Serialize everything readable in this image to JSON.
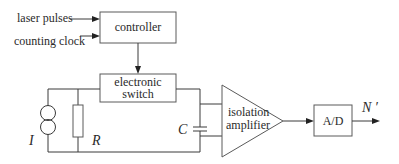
{
  "diagram": {
    "inputs": {
      "laser_pulses": "laser pulses",
      "counting_clock": "counting clock"
    },
    "blocks": {
      "controller": "controller",
      "switch_line1": "electronic",
      "switch_line2": "switch",
      "amplifier_line1": "isolation",
      "amplifier_line2": "amplifier",
      "adc": "A/D"
    },
    "components": {
      "current_source": "I",
      "resistor": "R",
      "capacitor": "C"
    },
    "output": "N ′"
  }
}
